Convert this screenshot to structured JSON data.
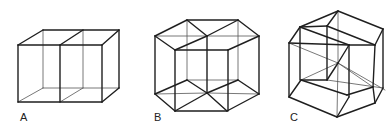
{
  "figures": [
    {
      "id": "A",
      "label": "A",
      "label_pos": [
        20,
        112
      ],
      "description": "Two adjoining cubes (3D projection of a double cube)",
      "edges": [
        [
          18,
          45,
          102,
          45
        ],
        [
          102,
          45,
          102,
          102
        ],
        [
          102,
          102,
          18,
          102
        ],
        [
          18,
          102,
          18,
          45
        ],
        [
          43,
          30,
          119,
          30
        ],
        [
          119,
          30,
          119,
          88
        ],
        [
          18,
          45,
          43,
          30
        ],
        [
          102,
          45,
          119,
          30
        ],
        [
          102,
          102,
          119,
          88
        ],
        [
          60,
          45,
          60,
          102
        ],
        [
          60,
          45,
          83,
          30
        ]
      ],
      "thin_edges": [
        [
          43,
          30,
          43,
          88
        ],
        [
          43,
          88,
          119,
          88
        ],
        [
          18,
          102,
          43,
          88
        ],
        [
          83,
          30,
          83,
          88
        ],
        [
          60,
          102,
          83,
          88
        ]
      ]
    },
    {
      "id": "B",
      "label": "B",
      "label_pos": [
        154,
        112
      ],
      "description": "Hypercube projection with hexagonal outline",
      "edges": [
        [
          155,
          36,
          187,
          20
        ],
        [
          187,
          20,
          238,
          20
        ],
        [
          238,
          20,
          259,
          36
        ],
        [
          155,
          36,
          175,
          50
        ],
        [
          175,
          50,
          207,
          36
        ],
        [
          207,
          36,
          187,
          20
        ],
        [
          207,
          36,
          238,
          20
        ],
        [
          175,
          50,
          228,
          50
        ],
        [
          228,
          50,
          259,
          36
        ],
        [
          155,
          36,
          155,
          94
        ],
        [
          259,
          36,
          259,
          94
        ],
        [
          175,
          50,
          175,
          111
        ],
        [
          228,
          50,
          228,
          111
        ],
        [
          155,
          94,
          175,
          111
        ],
        [
          175,
          111,
          227,
          111
        ],
        [
          227,
          111,
          259,
          94
        ],
        [
          155,
          94,
          187,
          80
        ],
        [
          187,
          80,
          207,
          93
        ],
        [
          207,
          93,
          175,
          111
        ],
        [
          207,
          93,
          227,
          111
        ],
        [
          207,
          93,
          238,
          80
        ],
        [
          238,
          80,
          259,
          94
        ],
        [
          207,
          36,
          207,
          93
        ]
      ],
      "thin_edges": [
        [
          187,
          20,
          187,
          80
        ],
        [
          238,
          20,
          238,
          80
        ],
        [
          187,
          80,
          238,
          80
        ],
        [
          155,
          94,
          207,
          93
        ],
        [
          207,
          93,
          259,
          94
        ],
        [
          207,
          36,
          259,
          36
        ],
        [
          155,
          36,
          207,
          36
        ]
      ]
    },
    {
      "id": "C",
      "label": "C",
      "label_pos": [
        290,
        112
      ],
      "description": "Tesseract (4D hypercube) oblique projection",
      "edges": [
        [
          289,
          43,
          300,
          27
        ],
        [
          300,
          27,
          338,
          11
        ],
        [
          338,
          11,
          383,
          29
        ],
        [
          338,
          11,
          327,
          26
        ],
        [
          300,
          27,
          327,
          26
        ],
        [
          289,
          43,
          349,
          45
        ],
        [
          327,
          26,
          375,
          45
        ],
        [
          383,
          29,
          375,
          45
        ],
        [
          349,
          45,
          375,
          45
        ],
        [
          300,
          27,
          349,
          45
        ],
        [
          289,
          43,
          289,
          97
        ],
        [
          300,
          27,
          300,
          80
        ],
        [
          327,
          26,
          327,
          80
        ],
        [
          349,
          45,
          349,
          97
        ],
        [
          375,
          45,
          373,
          87
        ],
        [
          383,
          29,
          383,
          88
        ],
        [
          289,
          97,
          337,
          117
        ],
        [
          337,
          117,
          375,
          103
        ],
        [
          375,
          103,
          383,
          88
        ],
        [
          289,
          97,
          301,
          80
        ],
        [
          301,
          80,
          347,
          95
        ],
        [
          347,
          95,
          373,
          87
        ],
        [
          349,
          97,
          337,
          117
        ],
        [
          373,
          87,
          375,
          103
        ],
        [
          327,
          80,
          338,
          63
        ],
        [
          338,
          63,
          349,
          45
        ],
        [
          301,
          80,
          327,
          80
        ]
      ],
      "thin_edges": [
        [
          338,
          11,
          338,
          63
        ],
        [
          338,
          63,
          301,
          80
        ],
        [
          338,
          63,
          385,
          90
        ],
        [
          338,
          63,
          289,
          43
        ],
        [
          338,
          63,
          373,
          87
        ],
        [
          338,
          63,
          337,
          117
        ],
        [
          327,
          80,
          383,
          88
        ]
      ]
    }
  ]
}
